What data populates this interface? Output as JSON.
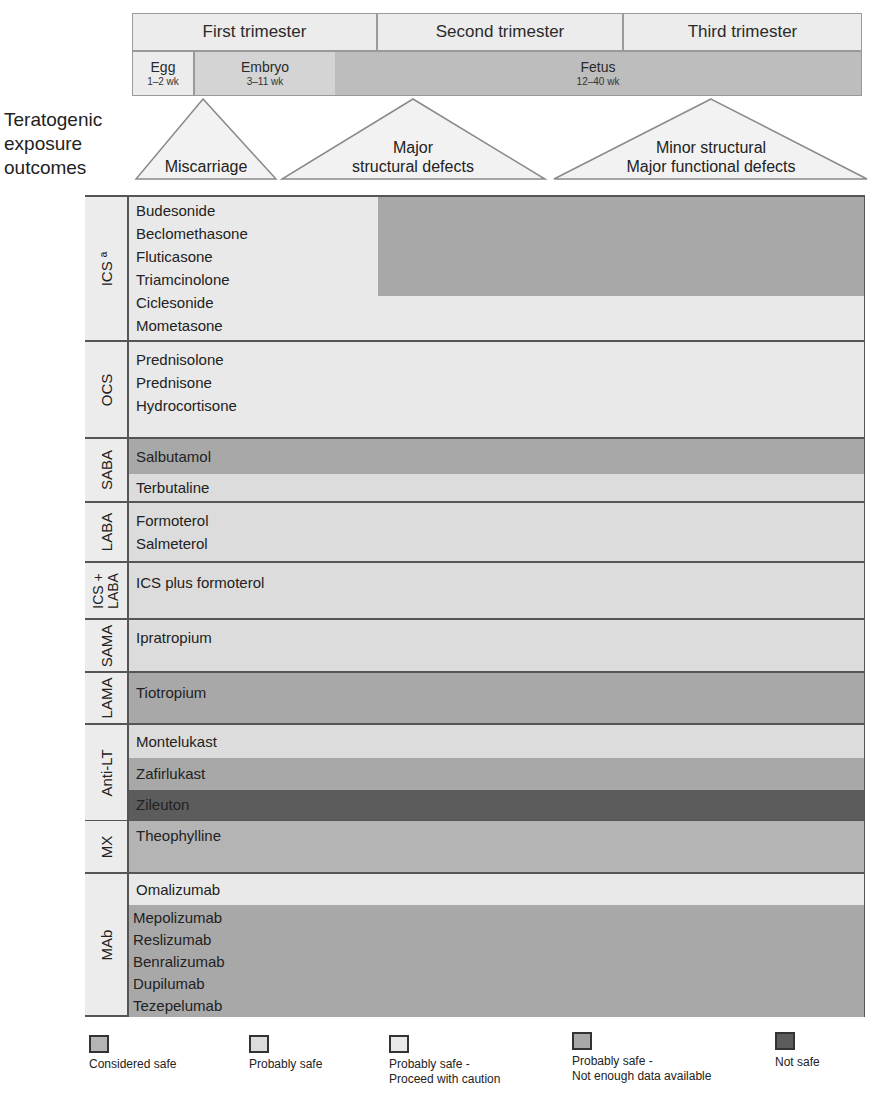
{
  "header": {
    "trimesters": [
      "First trimester",
      "Second trimester",
      "Third trimester"
    ],
    "stages": [
      {
        "name": "Egg",
        "weeks": "1–2 wk"
      },
      {
        "name": "Embryo",
        "weeks": "3–11 wk"
      },
      {
        "name": "Fetus",
        "weeks": "12–40 wk"
      }
    ]
  },
  "outcomes": {
    "title_lines": [
      "Teratogenic",
      "exposure",
      "outcomes"
    ],
    "items": [
      {
        "lines": [
          "Miscarriage"
        ]
      },
      {
        "lines": [
          "Major",
          "structural defects"
        ]
      },
      {
        "lines": [
          "Minor structural",
          "Major functional defects"
        ]
      }
    ]
  },
  "groups": [
    {
      "label": "ICS ª",
      "drugs": [
        "Budesonide",
        "Beclomethasone",
        "Fluticasone",
        "Triamcinolone",
        "Ciclesonide",
        "Mometasone"
      ]
    },
    {
      "label": "OCS",
      "drugs": [
        "Prednisolone",
        "Prednisone",
        "Hydrocortisone"
      ]
    },
    {
      "label": "SABA",
      "drugs": [
        "Salbutamol",
        "Terbutaline"
      ]
    },
    {
      "label": "LABA",
      "drugs": [
        "Formoterol",
        "Salmeterol"
      ]
    },
    {
      "label_lines": [
        "ICS +",
        "LABA"
      ],
      "drugs": [
        "ICS plus formoterol"
      ]
    },
    {
      "label": "SAMA",
      "drugs": [
        "Ipratropium"
      ]
    },
    {
      "label": "LAMA",
      "drugs": [
        "Tiotropium"
      ]
    },
    {
      "label": "Anti-LT",
      "drugs": [
        "Montelukast",
        "Zafirlukast",
        "Zileuton"
      ]
    },
    {
      "label": "MX",
      "drugs": [
        "Theophylline"
      ]
    },
    {
      "label": "MAb",
      "drugs": [
        "Omalizumab",
        "Mepolizumab",
        "Reslizumab",
        "Benralizumab",
        "Dupilumab",
        "Tezepelumab"
      ]
    }
  ],
  "legend": [
    {
      "label_lines": [
        "Considered safe"
      ],
      "color": "#b4b4b4"
    },
    {
      "label_lines": [
        "Probably safe"
      ],
      "color": "#dcdcdc"
    },
    {
      "label_lines": [
        "Probably safe -",
        "Proceed with caution"
      ],
      "color": "#e9e9e9"
    },
    {
      "label_lines": [
        "Probably safe -",
        "Not enough data available"
      ],
      "color": "#a8a8a8"
    },
    {
      "label_lines": [
        "Not safe"
      ],
      "color": "#5c5c5c"
    }
  ]
}
